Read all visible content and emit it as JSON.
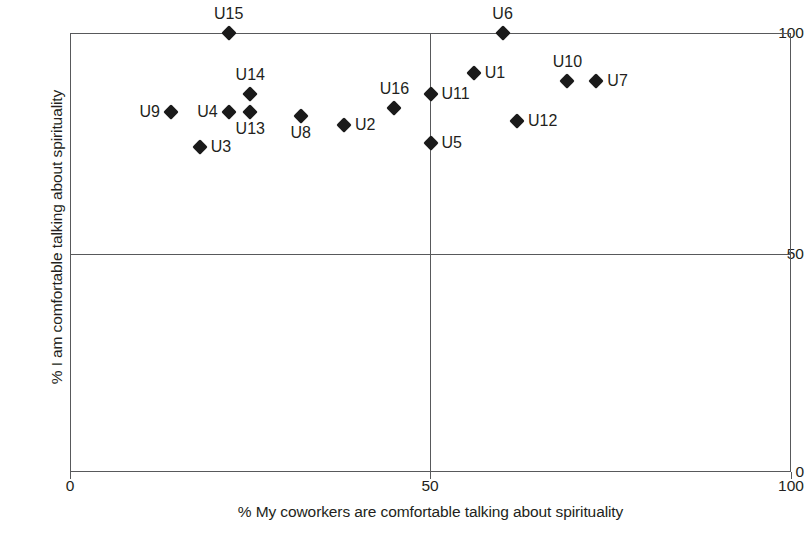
{
  "chart_data": {
    "type": "scatter",
    "title": "",
    "xlabel": "% My coworkers are comfortable talking about spirituality",
    "ylabel": "% I am comfortable talking about spirituality",
    "xlim": [
      0,
      100
    ],
    "ylim": [
      0,
      100
    ],
    "xticks": [
      "0",
      "50",
      "100"
    ],
    "yticks": [
      "0",
      "50",
      "100"
    ],
    "grid": "quadrant-lines-at-50",
    "legend": "none",
    "marker": "filled-diamond",
    "marker_color": "#1a1a1a",
    "points": [
      {
        "label": "U15",
        "x": 22,
        "y": 100,
        "label_pos": "above"
      },
      {
        "label": "U6",
        "x": 60,
        "y": 100,
        "label_pos": "above"
      },
      {
        "label": "U14",
        "x": 25,
        "y": 86,
        "label_pos": "above"
      },
      {
        "label": "U1",
        "x": 56,
        "y": 91,
        "label_pos": "right"
      },
      {
        "label": "U10",
        "x": 69,
        "y": 89,
        "label_pos": "above"
      },
      {
        "label": "U7",
        "x": 73,
        "y": 89,
        "label_pos": "right"
      },
      {
        "label": "U9",
        "x": 14,
        "y": 82,
        "label_pos": "left"
      },
      {
        "label": "U4",
        "x": 22,
        "y": 82,
        "label_pos": "left"
      },
      {
        "label": "U13",
        "x": 25,
        "y": 82,
        "label_pos": "below"
      },
      {
        "label": "U16",
        "x": 45,
        "y": 83,
        "label_pos": "above"
      },
      {
        "label": "U11",
        "x": 50,
        "y": 86,
        "label_pos": "right"
      },
      {
        "label": "U8",
        "x": 32,
        "y": 81,
        "label_pos": "below"
      },
      {
        "label": "U2",
        "x": 38,
        "y": 79,
        "label_pos": "right"
      },
      {
        "label": "U12",
        "x": 62,
        "y": 80,
        "label_pos": "right"
      },
      {
        "label": "U5",
        "x": 50,
        "y": 75,
        "label_pos": "right"
      },
      {
        "label": "U3",
        "x": 18,
        "y": 74,
        "label_pos": "right"
      }
    ]
  }
}
